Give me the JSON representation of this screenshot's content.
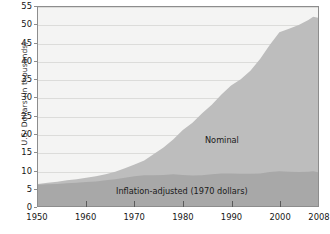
{
  "chart_data": {
    "type": "area",
    "title": "",
    "subtitle": "",
    "xlabel": "",
    "ylabel": "U.S. Dollars (in thousands)",
    "xlim": [
      1950,
      2008
    ],
    "ylim": [
      0,
      55
    ],
    "ytick_step": 5,
    "grid": true,
    "legend_position": "in-plot-annotations",
    "x_ticks": [
      "1950",
      "1960",
      "1970",
      "1980",
      "1990",
      "2000",
      "2008"
    ],
    "x_tick_values": [
      1950,
      1960,
      1970,
      1980,
      1990,
      2000,
      2008
    ],
    "y_ticks": [
      "0",
      "5",
      "10",
      "15",
      "20",
      "25",
      "30",
      "35",
      "40",
      "45",
      "50",
      "55"
    ],
    "y_tick_values": [
      0,
      5,
      10,
      15,
      20,
      25,
      30,
      35,
      40,
      45,
      50,
      55
    ],
    "annotations": [
      {
        "name": "nominal-label",
        "text": "Nominal",
        "x": 1993,
        "y": 20
      },
      {
        "name": "inflation-adjusted-label",
        "text": "Inflation-adjusted (1970 dollars)",
        "x": 1978,
        "y": 4
      }
    ],
    "colors": {
      "nominal_fill": "#bdbdbd",
      "inflation_fill": "#a8a8a8",
      "plot_background": "#f4f4f3",
      "gridline": "#dcdcda",
      "axis_border": "#8d8d8d",
      "text": "#161616"
    },
    "series": [
      {
        "name": "Nominal",
        "fill_color": "#bdbdbd",
        "x": [
          1950,
          1952,
          1954,
          1956,
          1958,
          1960,
          1962,
          1964,
          1966,
          1968,
          1970,
          1972,
          1974,
          1976,
          1978,
          1980,
          1982,
          1984,
          1986,
          1988,
          1990,
          1992,
          1994,
          1996,
          1998,
          2000,
          2002,
          2004,
          2006,
          2007,
          2008
        ],
        "values": [
          6.1,
          6.4,
          6.7,
          7.1,
          7.4,
          7.8,
          8.2,
          8.8,
          9.5,
          10.4,
          11.5,
          12.6,
          14.4,
          16.2,
          18.4,
          21.0,
          23.0,
          25.6,
          28.0,
          30.8,
          33.3,
          35.0,
          37.4,
          40.6,
          44.5,
          48.0,
          49.0,
          50.0,
          51.4,
          52.3,
          52.0
        ],
        "y_unit": "thousands of U.S. dollars"
      },
      {
        "name": "Inflation-adjusted (1970 dollars)",
        "fill_color": "#a8a8a8",
        "x": [
          1950,
          1952,
          1954,
          1956,
          1958,
          1960,
          1962,
          1964,
          1966,
          1968,
          1970,
          1972,
          1974,
          1976,
          1978,
          1980,
          1982,
          1984,
          1986,
          1988,
          1990,
          1992,
          1994,
          1996,
          1998,
          2000,
          2002,
          2004,
          2006,
          2007,
          2008
        ],
        "values": [
          5.9,
          6.0,
          6.1,
          6.3,
          6.4,
          6.6,
          6.8,
          7.1,
          7.4,
          7.8,
          8.2,
          8.5,
          8.5,
          8.6,
          8.8,
          8.6,
          8.4,
          8.5,
          8.8,
          9.0,
          9.0,
          8.9,
          8.9,
          9.0,
          9.4,
          9.6,
          9.5,
          9.4,
          9.5,
          9.6,
          9.3
        ],
        "y_unit": "thousands of 1970 U.S. dollars"
      }
    ]
  }
}
